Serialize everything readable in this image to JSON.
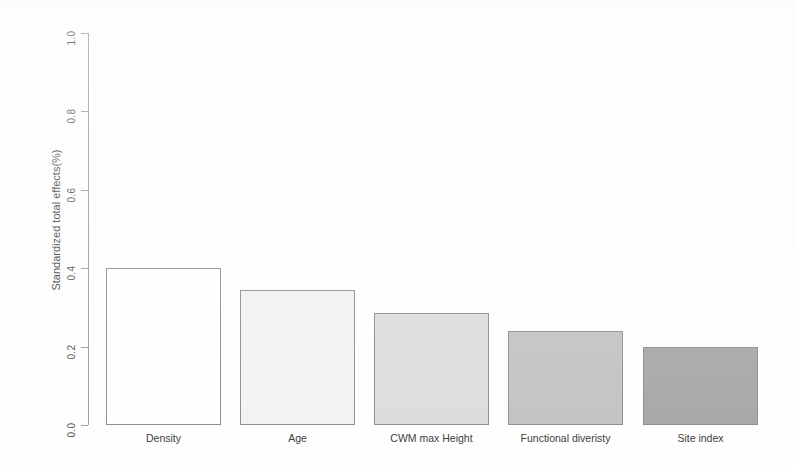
{
  "chart_data": {
    "type": "bar",
    "title": "",
    "subtitle": "",
    "xlabel": "",
    "ylabel": "Standardized total effects(%)",
    "categories": [
      "Density",
      "Age",
      "CWM max Height",
      "Functional diveristy",
      "Site index"
    ],
    "values": [
      0.4,
      0.345,
      0.285,
      0.24,
      0.2
    ],
    "ylim": [
      0.0,
      1.0
    ],
    "ytick_labels": [
      "1.0",
      "0.8",
      "0.6",
      "0.4",
      "0.2",
      "0.0"
    ],
    "ytick_values": [
      1.0,
      0.8,
      0.6,
      0.4,
      0.2,
      0.0
    ],
    "grid": false,
    "legend": false,
    "legend_position": "none",
    "bar_colors": [
      "#ffffff",
      "#f2f2f2",
      "#dcdcdc",
      "#c2c2c2",
      "#a6a6a6"
    ],
    "bar_border_color": "#8c8c8c",
    "axis_color": "#9a9a9a",
    "text_color": "#3a3a3a",
    "background_color": "#fefefe"
  }
}
